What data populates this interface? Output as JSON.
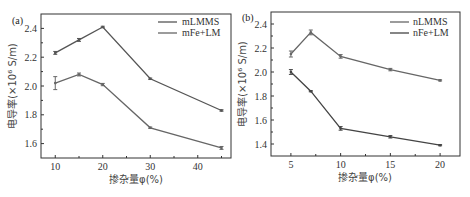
{
  "chart_data": [
    {
      "type": "line",
      "panel": "(a)",
      "title": "",
      "xlabel": "掺杂量φ(%)",
      "ylabel": "电导率(×10⁶ S/m)",
      "x": [
        10,
        15,
        20,
        30,
        45
      ],
      "xticks": [
        10,
        20,
        30,
        40
      ],
      "xlim": [
        7,
        47
      ],
      "yticks": [
        1.6,
        1.8,
        2.0,
        2.2,
        2.4
      ],
      "ylim": [
        1.5,
        2.5
      ],
      "grid": false,
      "legend_position": "upper right",
      "series": [
        {
          "name": "mLMMS",
          "values": [
            2.23,
            2.32,
            2.41,
            2.05,
            1.83
          ],
          "color": "#555555",
          "errors": [
            0.01,
            0.01,
            0.005,
            0.005,
            0.005
          ]
        },
        {
          "name": "mFe+LM",
          "values": [
            2.02,
            2.08,
            2.01,
            1.71,
            1.57
          ],
          "color": "#666666",
          "errors": [
            0.045,
            0.01,
            0.008,
            0.005,
            0.01
          ]
        }
      ]
    },
    {
      "type": "line",
      "panel": "(b)",
      "title": "",
      "xlabel": "掺杂量φ(%)",
      "ylabel": "电导率(×10⁶ S/m)",
      "x": [
        5,
        7,
        10,
        15,
        20
      ],
      "xticks": [
        5,
        10,
        15,
        20
      ],
      "xlim": [
        3,
        22
      ],
      "yticks": [
        1.4,
        1.6,
        1.8,
        2.0,
        2.2,
        2.4
      ],
      "ylim": [
        1.3,
        2.5
      ],
      "grid": false,
      "legend_position": "upper right",
      "series": [
        {
          "name": "nLMMS",
          "values": [
            2.15,
            2.33,
            2.13,
            2.02,
            1.93
          ],
          "color": "#666666",
          "errors": [
            0.025,
            0.02,
            0.015,
            0.01,
            0.005
          ]
        },
        {
          "name": "nFe+LM",
          "values": [
            2.0,
            1.84,
            1.53,
            1.46,
            1.39
          ],
          "color": "#444444",
          "errors": [
            0.02,
            0.005,
            0.015,
            0.01,
            0.005
          ]
        }
      ]
    }
  ],
  "panels": {
    "a": {
      "label": "(a)",
      "xlabel": "掺杂量φ(%)",
      "ylabel": "电导率(×10⁶ S/m)",
      "legend": [
        "mLMMS",
        "mFe+LM"
      ],
      "xtick_labels": [
        "10",
        "20",
        "30",
        "40"
      ],
      "ytick_labels": [
        "1.6",
        "1.8",
        "2.0",
        "2.2",
        "2.4"
      ]
    },
    "b": {
      "label": "(b)",
      "xlabel": "掺杂量φ(%)",
      "ylabel": "电导率(×10⁶ S/m)",
      "legend": [
        "nLMMS",
        "nFe+LM"
      ],
      "xtick_labels": [
        "5",
        "10",
        "15",
        "20"
      ],
      "ytick_labels": [
        "1.4",
        "1.6",
        "1.8",
        "2.0",
        "2.2",
        "2.4"
      ]
    }
  }
}
